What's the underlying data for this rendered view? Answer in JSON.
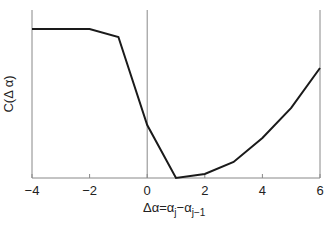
{
  "chart_data": {
    "type": "line",
    "title": "",
    "xlabel": "Δα=α_j−α_{j−1}",
    "ylabel": "C(Δ α)",
    "x": [
      -4,
      -2,
      -1,
      0,
      1,
      2,
      3,
      4,
      5,
      6
    ],
    "series": [
      {
        "name": "C(Δα)",
        "values": [
          0.887,
          0.887,
          0.839,
          0.315,
          0.0,
          0.024,
          0.095,
          0.238,
          0.417,
          0.655
        ],
        "color": "#1a1a1a"
      }
    ],
    "xlim": [
      -4,
      6
    ],
    "ylim": [
      0,
      1
    ],
    "xticks": [
      -4,
      -2,
      0,
      2,
      4,
      6
    ],
    "xtick_labels": [
      "−4",
      "−2",
      "0",
      "2",
      "4",
      "6"
    ],
    "yticks": [],
    "grid": false,
    "reference_line_x": 0,
    "legend": null
  },
  "labels": {
    "ylabel_text": "C(Δ α)",
    "xlabel_main": "Δα=α",
    "xlabel_sub_j": "j",
    "xlabel_minus": "−α",
    "xlabel_sub_j1": "j−1"
  }
}
